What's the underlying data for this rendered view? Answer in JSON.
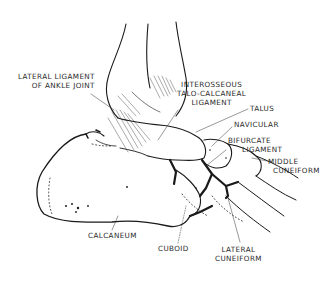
{
  "diagram": {
    "labels": [
      {
        "id": "lateral-ligament",
        "lines": [
          "LATERAL LIGAMENT",
          "OF ANKLE JOINT"
        ]
      },
      {
        "id": "interosseous",
        "lines": [
          "INTEROSSEOUS",
          "TALO-CALCANEAL",
          "LIGAMENT"
        ]
      },
      {
        "id": "talus",
        "lines": [
          "TALUS"
        ]
      },
      {
        "id": "navicular",
        "lines": [
          "NAVICULAR"
        ]
      },
      {
        "id": "bifurcate",
        "lines": [
          "BIFURCATE",
          "LIGAMENT"
        ]
      },
      {
        "id": "middle-cuneiform",
        "lines": [
          "MIDDLE",
          "CUNEIFORM"
        ]
      },
      {
        "id": "calcaneum",
        "lines": [
          "CALCANEUM"
        ]
      },
      {
        "id": "cuboid",
        "lines": [
          "CUBOID"
        ]
      },
      {
        "id": "lateral-cuneiform",
        "lines": [
          "LATERAL",
          "CUNEIFORM"
        ]
      }
    ],
    "colors": {
      "ink": "#1a1a1a",
      "background": "#ffffff",
      "label": "#2a2a2a"
    }
  }
}
